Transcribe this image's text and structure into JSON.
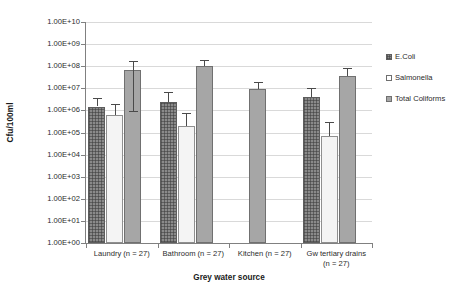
{
  "chart_data": {
    "type": "bar",
    "title": "",
    "xlabel": "Grey water source",
    "ylabel": "Cfu/100ml",
    "categories": [
      "Laundry (n = 27)",
      "Bathroom (n = 27)",
      "Kitchen (n = 27)",
      "Gw tertiary drains\n(n = 27)"
    ],
    "yscale": "log",
    "ylim": [
      1,
      10000000000
    ],
    "yticks": [
      "1.00E+00",
      "1.00E+01",
      "1.00E+02",
      "1.00E+03",
      "1.00E+04",
      "1.00E+05",
      "1.00E+06",
      "1.00E+07",
      "1.00E+08",
      "1.00E+09",
      "1.00E+10"
    ],
    "grid": true,
    "legend_position": "right",
    "series": [
      {
        "name": "E.Coli",
        "values": [
          1500000,
          2500000,
          null,
          4000000
        ],
        "err_low": [
          1500000,
          2500000,
          null,
          4000000
        ],
        "err_high": [
          3800000,
          7000000,
          null,
          10000000
        ]
      },
      {
        "name": "Salmonella",
        "values": [
          600000,
          200000,
          null,
          70000
        ],
        "err_low": [
          600000,
          200000,
          null,
          70000
        ],
        "err_high": [
          2000000,
          800000,
          null,
          300000
        ]
      },
      {
        "name": "Total Coliforms",
        "values": [
          70000000,
          100000000,
          9000000,
          35000000
        ],
        "err_low": [
          900000,
          100000000,
          9000000,
          35000000
        ],
        "err_high": [
          180000000,
          200000000,
          20000000,
          80000000
        ]
      }
    ]
  },
  "legend": {
    "items": [
      {
        "label": "E.Coli",
        "key": "ecoli"
      },
      {
        "label": "Salmonella",
        "key": "salmonella"
      },
      {
        "label": "Total Coliforms",
        "key": "coliforms"
      }
    ]
  },
  "axes": {
    "y_title": "Cfu/100ml",
    "x_title": "Grey water source"
  }
}
